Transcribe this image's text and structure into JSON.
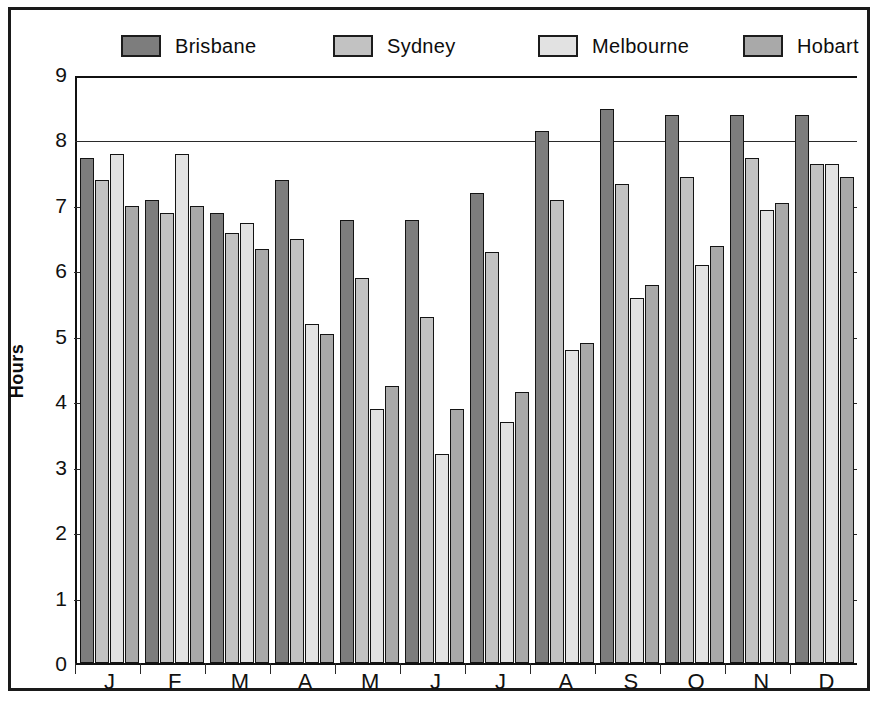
{
  "legend": {
    "entries": [
      {
        "label": "Brisbane",
        "color": "#7d7d7d"
      },
      {
        "label": "Sydney",
        "color": "#c2c2c2"
      },
      {
        "label": "Melbourne",
        "color": "#e2e2e2"
      },
      {
        "label": "Hobart",
        "color": "#a9a9a9"
      }
    ]
  },
  "axes": {
    "ylabel": "Hours",
    "yticks": [
      "9",
      "8",
      "7",
      "6",
      "5",
      "4",
      "3",
      "2",
      "1",
      "0"
    ],
    "xticks": [
      "J",
      "F",
      "M",
      "A",
      "M",
      "J",
      "J",
      "A",
      "S",
      "O",
      "N",
      "D"
    ]
  },
  "chart_data": {
    "type": "bar",
    "title": "",
    "xlabel": "",
    "ylabel": "Hours",
    "ylim": [
      0,
      9
    ],
    "grid": true,
    "legend_position": "top",
    "categories": [
      "J",
      "F",
      "M",
      "A",
      "M",
      "J",
      "J",
      "A",
      "S",
      "O",
      "N",
      "D"
    ],
    "series": [
      {
        "name": "Brisbane",
        "color": "#7d7d7d",
        "values": [
          7.75,
          7.1,
          6.9,
          7.4,
          6.8,
          6.8,
          7.2,
          8.15,
          8.5,
          8.4,
          8.4,
          8.4
        ]
      },
      {
        "name": "Sydney",
        "color": "#c2c2c2",
        "values": [
          7.4,
          6.9,
          6.6,
          6.5,
          5.9,
          5.3,
          6.3,
          7.1,
          7.35,
          7.45,
          7.75,
          7.65
        ]
      },
      {
        "name": "Melbourne",
        "color": "#e2e2e2",
        "values": [
          7.8,
          7.8,
          6.75,
          5.2,
          3.9,
          3.2,
          3.7,
          4.8,
          5.6,
          6.1,
          6.95,
          7.65
        ]
      },
      {
        "name": "Hobart",
        "color": "#a9a9a9",
        "values": [
          7.0,
          7.0,
          6.35,
          5.05,
          4.25,
          3.9,
          4.15,
          4.9,
          5.8,
          6.4,
          7.05,
          7.45
        ]
      }
    ]
  }
}
